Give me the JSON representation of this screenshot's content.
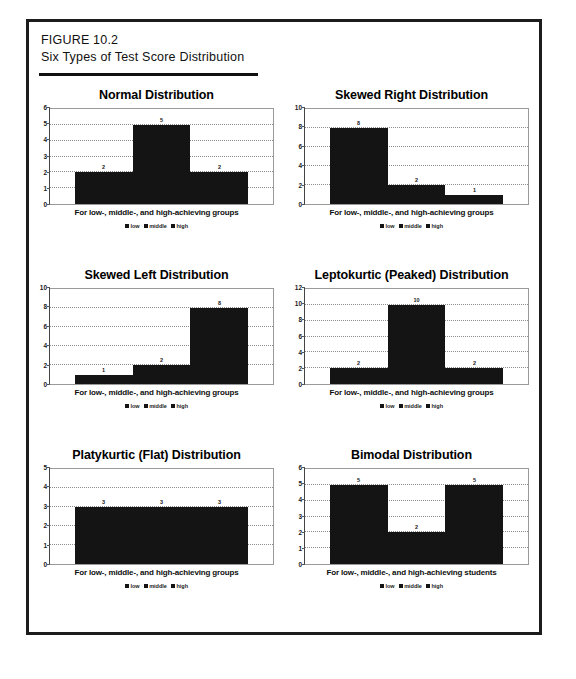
{
  "figure": {
    "number": "FIGURE 10.2",
    "title": "Six Types of Test Score Distribution"
  },
  "legend": {
    "items": [
      {
        "label": "low",
        "color": "#141414"
      },
      {
        "label": "middle",
        "color": "#141414"
      },
      {
        "label": "high",
        "color": "#141414"
      }
    ]
  },
  "x_axis_labels": {
    "groups": "For low-, middle-, and high-achieving groups",
    "students": "For low-, middle-, and high-achieving students"
  },
  "colors": {
    "bar": "#141414",
    "frame": "#1c1c1c",
    "gridline": "#8c8c8c",
    "plot_border": "#9a9a9a"
  },
  "chart_data": [
    {
      "type": "bar",
      "title": "Normal Distribution",
      "categories": [
        "low",
        "middle",
        "high"
      ],
      "values": [
        2,
        5,
        2
      ],
      "xlabel": "For low-, middle-, and high-achieving groups",
      "ylabel": "",
      "ylim": [
        0,
        6
      ],
      "yticks": [
        0,
        1,
        2,
        3,
        4,
        5,
        6
      ],
      "grid": true,
      "legend": [
        "low",
        "middle",
        "high"
      ],
      "legend_position": "bottom"
    },
    {
      "type": "bar",
      "title": "Skewed Right Distribution",
      "categories": [
        "low",
        "middle",
        "high"
      ],
      "values": [
        8,
        2,
        1
      ],
      "xlabel": "For low-, middle-, and high-achieving groups",
      "ylabel": "",
      "ylim": [
        0,
        10
      ],
      "yticks": [
        0,
        2,
        4,
        6,
        8,
        10
      ],
      "grid": true,
      "legend": [
        "low",
        "middle",
        "high"
      ],
      "legend_position": "bottom"
    },
    {
      "type": "bar",
      "title": "Skewed Left Distribution",
      "categories": [
        "low",
        "middle",
        "high"
      ],
      "values": [
        1,
        2,
        8
      ],
      "xlabel": "For low-, middle-, and high-achieving groups",
      "ylabel": "",
      "ylim": [
        0,
        10
      ],
      "yticks": [
        0,
        2,
        4,
        6,
        8,
        10
      ],
      "grid": true,
      "legend": [
        "low",
        "middle",
        "high"
      ],
      "legend_position": "bottom"
    },
    {
      "type": "bar",
      "title": "Leptokurtic (Peaked) Distribution",
      "categories": [
        "low",
        "middle",
        "high"
      ],
      "values": [
        2,
        10,
        2
      ],
      "xlabel": "For low-, middle-, and high-achieving groups",
      "ylabel": "",
      "ylim": [
        0,
        12
      ],
      "yticks": [
        0,
        2,
        4,
        6,
        8,
        10,
        12
      ],
      "grid": true,
      "legend": [
        "low",
        "middle",
        "high"
      ],
      "legend_position": "bottom"
    },
    {
      "type": "bar",
      "title": "Platykurtic (Flat) Distribution",
      "categories": [
        "low",
        "middle",
        "high"
      ],
      "values": [
        3,
        3,
        3
      ],
      "xlabel": "For low-, middle-, and high-achieving groups",
      "ylabel": "",
      "ylim": [
        0,
        5
      ],
      "yticks": [
        0,
        1,
        2,
        3,
        4,
        5
      ],
      "grid": true,
      "legend": [
        "low",
        "middle",
        "high"
      ],
      "legend_position": "bottom"
    },
    {
      "type": "bar",
      "title": "Bimodal Distribution",
      "categories": [
        "low",
        "middle",
        "high"
      ],
      "values": [
        5,
        2,
        5
      ],
      "xlabel": "For low-, middle-, and high-achieving students",
      "ylabel": "",
      "ylim": [
        0,
        6
      ],
      "yticks": [
        0,
        1,
        2,
        3,
        4,
        5,
        6
      ],
      "grid": true,
      "legend": [
        "low",
        "middle",
        "high"
      ],
      "legend_position": "bottom"
    }
  ]
}
